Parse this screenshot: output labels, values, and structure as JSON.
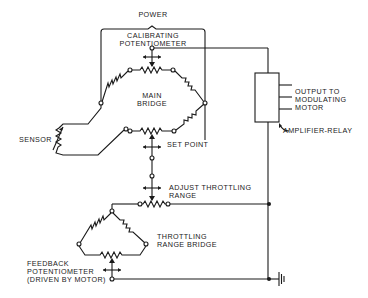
{
  "diagram": {
    "type": "electrical-schematic",
    "colors": {
      "line": "#1a1a1a",
      "background": "#ffffff"
    },
    "labels": {
      "power": "POWER",
      "calibrating_1": "CALIBRATING",
      "calibrating_2": "POTENTIOMETER",
      "main_bridge_1": "MAIN",
      "main_bridge_2": "BRIDGE",
      "sensor": "SENSOR",
      "set_point": "SET POINT",
      "output_1": "OUTPUT TO",
      "output_2": "MODULATING",
      "output_3": "MOTOR",
      "amplifier": "AMPLIFIER-RELAY",
      "adjust_1": "ADJUST THROTTLING",
      "adjust_2": "RANGE",
      "throttling_1": "THROTTLING",
      "throttling_2": "RANGE BRIDGE",
      "feedback_1": "FEEDBACK",
      "feedback_2": "POTENTIOMETER",
      "feedback_3": "(DRIVEN BY MOTOR)"
    },
    "components": [
      "calibrating-potentiometer",
      "main-bridge",
      "sensor-resistor",
      "set-point-potentiometer",
      "amplifier-relay",
      "adjust-throttling-range-potentiometer",
      "throttling-range-bridge",
      "feedback-potentiometer",
      "ground"
    ]
  }
}
